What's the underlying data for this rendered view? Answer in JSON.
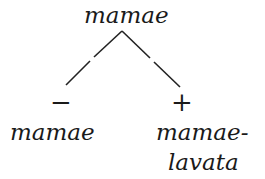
{
  "diagram": {
    "root": {
      "label": "mamae"
    },
    "children": [
      {
        "sign": "−",
        "label_lines": [
          "mamae"
        ]
      },
      {
        "sign": "+",
        "label_lines": [
          "mamae-",
          "lavata"
        ]
      }
    ]
  }
}
